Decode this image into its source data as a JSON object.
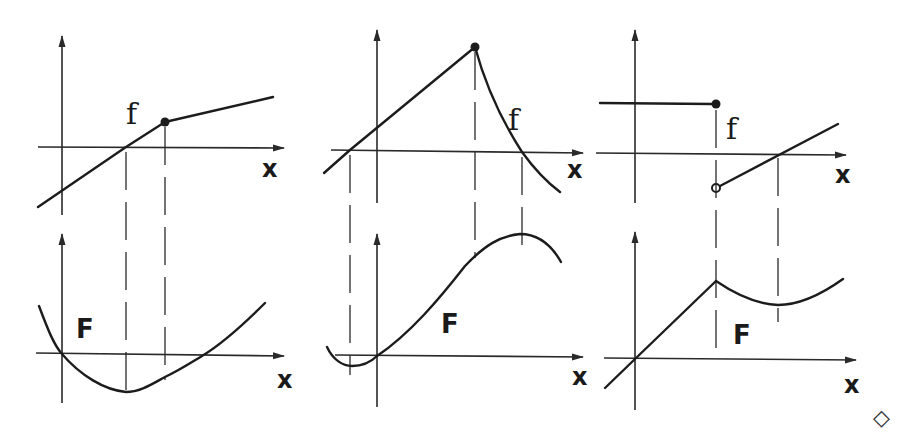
{
  "figure": {
    "end_marker": "◇",
    "panels": [
      {
        "id": "panel-1",
        "top": {
          "function_label": "f",
          "axis_label": "x",
          "shape": "piecewise linear, kink at filled point"
        },
        "bottom": {
          "function_label": "F",
          "axis_label": "x",
          "shape": "parabola-like, minimum where f crosses zero"
        }
      },
      {
        "id": "panel-2",
        "top": {
          "function_label": "f",
          "axis_label": "x",
          "shape": "rising line to peak (filled point), then decreasing curve"
        },
        "bottom": {
          "function_label": "F",
          "axis_label": "x",
          "shape": "S-curve with local min then max"
        }
      },
      {
        "id": "panel-3",
        "top": {
          "function_label": "f",
          "axis_label": "x",
          "shape": "step: constant with filled endpoint, jump to rising line with open endpoint"
        },
        "bottom": {
          "function_label": "F",
          "axis_label": "x",
          "shape": "linear rise to corner, then dip and rise"
        }
      }
    ]
  }
}
